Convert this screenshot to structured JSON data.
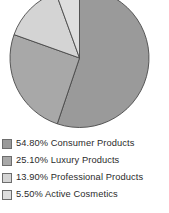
{
  "chart_data": {
    "type": "pie",
    "title": "",
    "subtitle": "",
    "xlabel": "",
    "ylabel": "",
    "grid": false,
    "legend_position": "bottom-left",
    "start_angle_deg": 0,
    "direction": "clockwise",
    "categories": [
      "Consumer Products",
      "Luxury Products",
      "Professional Products",
      "Active Cosmetics"
    ],
    "values": [
      54.8,
      25.1,
      13.9,
      5.5
    ],
    "value_labels": [
      "54.80%",
      "25.10%",
      "13.90%",
      "5.50%"
    ],
    "colors": [
      "#9a9a9a",
      "#a8a8a8",
      "#d4d4d4",
      "#dedede"
    ],
    "slice_outline_color": "#4a4a4a",
    "background_color": "#ffffff"
  },
  "legend": {
    "items": [
      {
        "value": "54.80%",
        "name": "Consumer Products",
        "text": "54.80% Consumer Products",
        "color": "#9a9a9a"
      },
      {
        "value": "25.10%",
        "name": "Luxury Products",
        "text": "25.10% Luxury Products",
        "color": "#a8a8a8"
      },
      {
        "value": "13.90%",
        "name": "Professional Products",
        "text": "13.90% Professional Products",
        "color": "#d4d4d4"
      },
      {
        "value": "5.50%",
        "name": "Active Cosmetics",
        "text": "5.50% Active Cosmetics",
        "color": "#dedede"
      }
    ]
  }
}
